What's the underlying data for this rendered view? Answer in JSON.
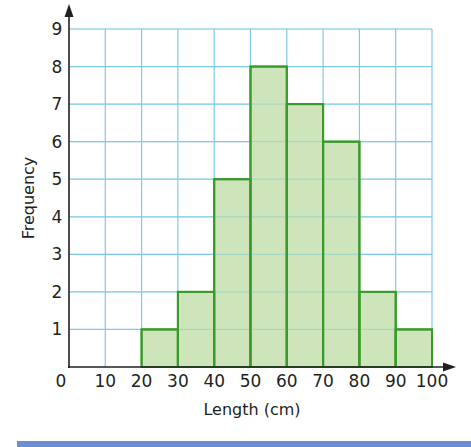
{
  "chart_data": {
    "type": "bar",
    "subtype": "histogram",
    "title": "",
    "xlabel": "Length (cm)",
    "ylabel": "Frequency",
    "bins": [
      {
        "from": 0,
        "to": 10,
        "frequency": 0
      },
      {
        "from": 10,
        "to": 20,
        "frequency": 0
      },
      {
        "from": 20,
        "to": 30,
        "frequency": 1
      },
      {
        "from": 30,
        "to": 40,
        "frequency": 2
      },
      {
        "from": 40,
        "to": 50,
        "frequency": 5
      },
      {
        "from": 50,
        "to": 60,
        "frequency": 8
      },
      {
        "from": 60,
        "to": 70,
        "frequency": 7
      },
      {
        "from": 70,
        "to": 80,
        "frequency": 6
      },
      {
        "from": 80,
        "to": 90,
        "frequency": 2
      },
      {
        "from": 90,
        "to": 100,
        "frequency": 1
      }
    ],
    "categories": [
      "0-10",
      "10-20",
      "20-30",
      "30-40",
      "40-50",
      "50-60",
      "60-70",
      "70-80",
      "80-90",
      "90-100"
    ],
    "values": [
      0,
      0,
      1,
      2,
      5,
      8,
      7,
      6,
      2,
      1
    ],
    "x_ticks": [
      0,
      10,
      20,
      30,
      40,
      50,
      60,
      70,
      80,
      90,
      100
    ],
    "y_ticks": [
      1,
      2,
      3,
      4,
      5,
      6,
      7,
      8,
      9
    ],
    "origin_label": "0",
    "xlim": [
      0,
      100
    ],
    "ylim": [
      0,
      9
    ],
    "grid": true,
    "legend": null
  },
  "colors": {
    "bar_fill": "#c5e0b0",
    "bar_stroke": "#3a9a2a",
    "grid": "#7fcbe6",
    "axis": "#231f20",
    "bottom_bar": "#6b8fcf"
  }
}
